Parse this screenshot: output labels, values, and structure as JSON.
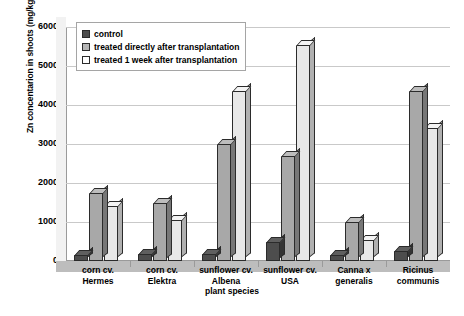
{
  "chart_data": {
    "type": "bar",
    "title": "",
    "xlabel": "plant species",
    "ylabel": "Zn concentarion in shoots (mg/kg)",
    "ylim": [
      0,
      6000
    ],
    "ytick_values": [
      0,
      1000,
      2000,
      3000,
      4000,
      5000,
      6000
    ],
    "ytick_labels": [
      "0",
      "1000",
      "2000",
      "3000",
      "4000",
      "5000",
      "6000"
    ],
    "grid": true,
    "legend_position": "top-left-inside",
    "categories": [
      "corn cv. Hermes",
      "corn cv. Elektra",
      "sunflower cv. Albena",
      "sunflower cv. USA",
      "Canna x generalis",
      "Ricinus communis"
    ],
    "category_lines": [
      [
        "corn cv.",
        "Hermes"
      ],
      [
        "corn cv.",
        "Elektra"
      ],
      [
        "sunflower cv.",
        "Albena"
      ],
      [
        "sunflower cv.",
        "USA"
      ],
      [
        "Canna x",
        "generalis"
      ],
      [
        "Ricinus",
        "communis"
      ]
    ],
    "series": [
      {
        "name": "control",
        "color": "#4d4d4d",
        "values": [
          150,
          170,
          180,
          500,
          150,
          250
        ]
      },
      {
        "name": "treated directly after transplantation",
        "color": "#b5b5b5",
        "values": [
          1750,
          1500,
          3000,
          2700,
          1000,
          4350
        ]
      },
      {
        "name": "treated 1 week after transplantation",
        "color": "#ffffff",
        "values": [
          1400,
          1050,
          4350,
          5550,
          550,
          3400
        ]
      }
    ]
  },
  "legend": {
    "items": [
      {
        "label": "control"
      },
      {
        "label": "treated directly after transplantation"
      },
      {
        "label": "treated 1 week after transplantation"
      }
    ]
  }
}
